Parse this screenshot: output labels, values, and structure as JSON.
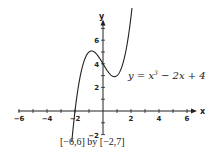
{
  "chart_data": {
    "type": "line",
    "title": "",
    "function_label": "y = x³ − 2x + 4",
    "function_label_parts": {
      "lhs": "y = x",
      "exp": "3",
      "rhs": " − 2x + 4"
    },
    "xlabel": "x",
    "ylabel": "y",
    "xlim": [
      -6,
      6
    ],
    "ylim": [
      -2,
      7
    ],
    "viewing_window": "[−6,6] by [−2,7]",
    "x_tick_labels": [
      "-6",
      "-4",
      "-2",
      "2",
      "4",
      "6"
    ],
    "y_tick_labels": [
      "-2",
      "2",
      "4",
      "6"
    ],
    "grid": false,
    "series": [
      {
        "name": "y = x^3 - 2x + 4",
        "x": [
          -2.2,
          -2.0,
          -1.5,
          -1.0,
          -0.816,
          -0.5,
          0.0,
          0.5,
          0.816,
          1.0,
          1.5,
          2.0,
          2.1
        ],
        "y": [
          -2.25,
          0.0,
          3.63,
          5.0,
          5.09,
          4.88,
          4.0,
          3.13,
          2.91,
          3.0,
          4.38,
          8.0,
          9.06
        ]
      }
    ],
    "color": "#222222"
  }
}
